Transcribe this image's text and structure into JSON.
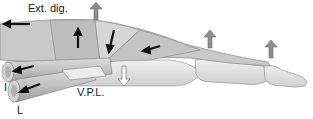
{
  "diagram": {
    "labels": {
      "extensor": "Ext. dig.",
      "interosseous": "I",
      "lumbrical": "L",
      "volar_plate": "V.P.L."
    },
    "arrows": {
      "black": "muscle pull direction",
      "gray_up": "extension force",
      "gray_down": "volar plate restraint"
    },
    "colors": {
      "tendon": "#c8c8c8",
      "tendon_dark": "#a5a5a5",
      "bone": "#e4e4e4",
      "bone_outline": "#9c9c9c",
      "arrow_black": "#111111",
      "arrow_gray": "#8e8e8e"
    }
  }
}
